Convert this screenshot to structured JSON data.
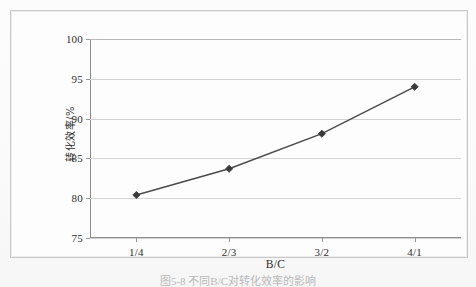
{
  "figure": {
    "caption": "图5-8 不同B/C对转化效率的影响"
  },
  "chart_data": {
    "type": "line",
    "title": "",
    "xlabel": "B/C",
    "ylabel": "转化效率/%",
    "categories": [
      "1/4",
      "2/3",
      "3/2",
      "4/1"
    ],
    "values": [
      80.4,
      83.7,
      88.1,
      94.0
    ],
    "series": [
      {
        "name": "转化效率",
        "values": [
          80.4,
          83.7,
          88.1,
          94.0
        ]
      }
    ],
    "ylim": [
      75,
      100
    ],
    "yticks": [
      75,
      80,
      85,
      90,
      95,
      100
    ],
    "ytick_labels": [
      "75",
      "80",
      "85",
      "90",
      "95",
      "100"
    ],
    "grid": "horizontal",
    "legend": "none",
    "marker": "diamond",
    "line_color": "#4a4a4a",
    "marker_color": "#3a3a3a",
    "grid_color": "#d3d3d3",
    "axis_color": "#8d8d8d",
    "background_color": "#fdfdfd"
  }
}
